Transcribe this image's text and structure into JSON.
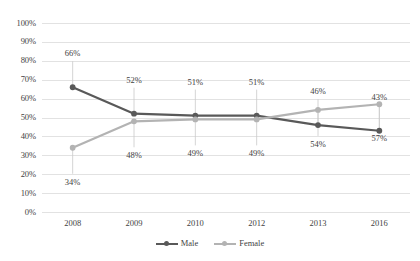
{
  "chart_data": {
    "type": "line",
    "title": "",
    "xlabel": "",
    "ylabel": "",
    "categories": [
      "2008",
      "2009",
      "2010",
      "2012",
      "2013",
      "2016"
    ],
    "ylim": [
      0,
      100
    ],
    "y_ticks": [
      "0%",
      "10%",
      "20%",
      "30%",
      "40%",
      "50%",
      "60%",
      "70%",
      "80%",
      "90%",
      "100%"
    ],
    "y_tick_values": [
      0,
      10,
      20,
      30,
      40,
      50,
      60,
      70,
      80,
      90,
      100
    ],
    "grid": true,
    "legend_position": "bottom-center",
    "value_suffix": "%",
    "series": [
      {
        "name": "Male",
        "color": "#595959",
        "marker": "circle",
        "label_position": "above",
        "values": [
          66,
          52,
          51,
          51,
          46,
          43
        ],
        "labels": [
          "66%",
          "52%",
          "51%",
          "51%",
          "46%",
          "43%"
        ]
      },
      {
        "name": "Female",
        "color": "#b3b3b3",
        "marker": "circle",
        "label_position": "below",
        "values": [
          34,
          48,
          49,
          49,
          54,
          57
        ],
        "labels": [
          "34%",
          "48%",
          "49%",
          "49%",
          "54%",
          "57%"
        ]
      }
    ]
  },
  "legend": {
    "items": [
      {
        "label": "Male"
      },
      {
        "label": "Female"
      }
    ]
  },
  "colors": {
    "male": "#595959",
    "female": "#b3b3b3",
    "gridline": "#e2e2e2",
    "leader_line": "#c9c9c9",
    "text": "#3f3f3f",
    "background": "#ffffff"
  }
}
